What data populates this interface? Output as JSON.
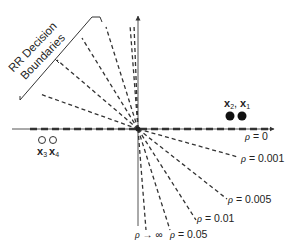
{
  "diagram": {
    "bracket_label_line1": "RR Decision",
    "bracket_label_line2": "Boundaries",
    "colors": {
      "ink": "#222222",
      "axis": "#555555",
      "dash": "#333333",
      "filled_point": "#111111",
      "open_point": "#333333"
    },
    "points": {
      "filled": {
        "label_a": "x",
        "sub_a": "2",
        "sep": ",",
        "label_b": "x",
        "sub_b": "1"
      },
      "open": {
        "label_a": "x",
        "sub_a": "3",
        "label_b": "x",
        "sub_b": "4"
      }
    },
    "boundaries_upper_count": 6,
    "boundaries_lower": [
      {
        "rho_symbol": "ρ",
        "rel": " = ",
        "value": "0"
      },
      {
        "rho_symbol": "ρ",
        "rel": " = ",
        "value": "0.001"
      },
      {
        "rho_symbol": "ρ",
        "rel": " = ",
        "value": "0.005"
      },
      {
        "rho_symbol": "ρ",
        "rel": " = ",
        "value": "0.01"
      },
      {
        "rho_symbol": "ρ",
        "rel": " = ",
        "value": "0.05"
      },
      {
        "rho_symbol": "ρ",
        "rel": " → ",
        "value": "∞"
      }
    ]
  }
}
